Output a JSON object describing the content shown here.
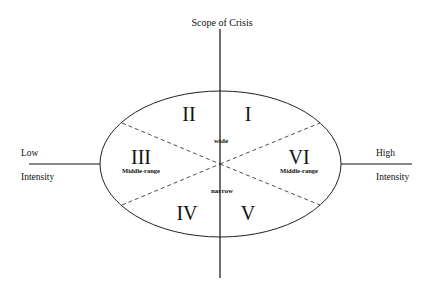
{
  "diagram": {
    "title": "Scope of Crisis",
    "left_axis": {
      "top": "Low",
      "bottom": "Intensity"
    },
    "right_axis": {
      "top": "High",
      "bottom": "Intensity"
    },
    "center_top": "wide",
    "center_bottom": "narrow",
    "sectors": [
      {
        "numeral": "I",
        "sub": ""
      },
      {
        "numeral": "II",
        "sub": ""
      },
      {
        "numeral": "III",
        "sub": "Middle-range"
      },
      {
        "numeral": "IV",
        "sub": ""
      },
      {
        "numeral": "V",
        "sub": ""
      },
      {
        "numeral": "VI",
        "sub": "Middle-range"
      }
    ]
  }
}
